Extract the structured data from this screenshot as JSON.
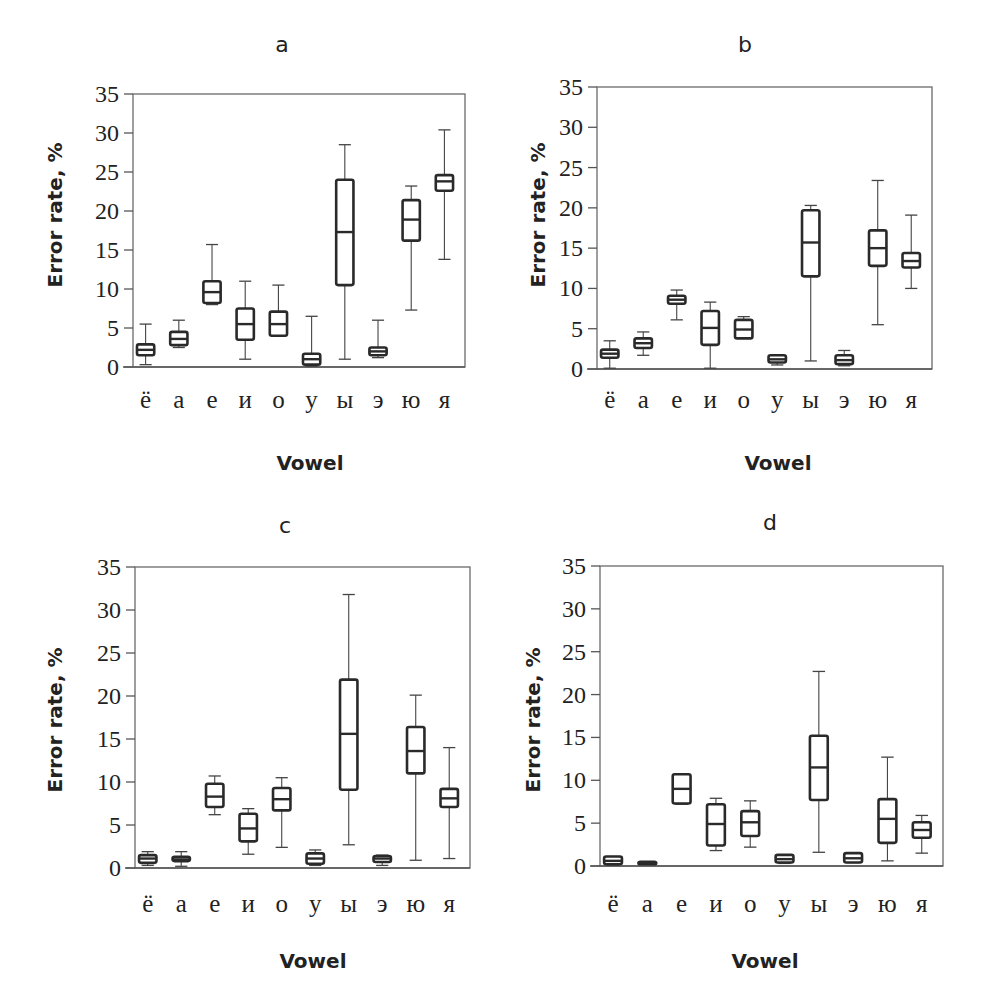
{
  "figure": {
    "panels_count": 4,
    "background_text_visible": true
  },
  "chart_data": [
    {
      "type": "box",
      "panel": "a",
      "title": "a",
      "xlabel": "Vowel",
      "ylabel": "Error rate, %",
      "ylim": [
        0,
        35
      ],
      "yticks": [
        0,
        5,
        10,
        15,
        20,
        25,
        30,
        35
      ],
      "grid": false,
      "categories": [
        "ё",
        "а",
        "е",
        "и",
        "о",
        "у",
        "ы",
        "э",
        "ю",
        "я"
      ],
      "series": [
        {
          "name": "ё",
          "min": 0.3,
          "q1": 1.5,
          "median": 2.2,
          "q3": 2.9,
          "max": 5.5
        },
        {
          "name": "а",
          "min": 2.5,
          "q1": 2.8,
          "median": 3.6,
          "q3": 4.5,
          "max": 6.0
        },
        {
          "name": "е",
          "min": 8.0,
          "q1": 8.2,
          "median": 9.6,
          "q3": 11.0,
          "max": 15.7
        },
        {
          "name": "и",
          "min": 1.0,
          "q1": 3.5,
          "median": 5.5,
          "q3": 7.5,
          "max": 11.0
        },
        {
          "name": "о",
          "min": 4.0,
          "q1": 4.0,
          "median": 5.5,
          "q3": 7.1,
          "max": 10.5
        },
        {
          "name": "у",
          "min": 0.1,
          "q1": 0.3,
          "median": 1.0,
          "q3": 1.7,
          "max": 6.5
        },
        {
          "name": "ы",
          "min": 1.0,
          "q1": 10.5,
          "median": 17.3,
          "q3": 24.0,
          "max": 28.5
        },
        {
          "name": "э",
          "min": 1.2,
          "q1": 1.5,
          "median": 2.0,
          "q3": 2.5,
          "max": 6.0
        },
        {
          "name": "ю",
          "min": 7.3,
          "q1": 16.2,
          "median": 18.9,
          "q3": 21.4,
          "max": 23.2
        },
        {
          "name": "я",
          "min": 13.8,
          "q1": 22.6,
          "median": 23.8,
          "q3": 24.6,
          "max": 30.4
        }
      ]
    },
    {
      "type": "box",
      "panel": "b",
      "title": "b",
      "xlabel": "Vowel",
      "ylabel": "Error rate, %",
      "ylim": [
        0,
        35
      ],
      "yticks": [
        0,
        5,
        10,
        15,
        20,
        25,
        30,
        35
      ],
      "grid": false,
      "categories": [
        "ё",
        "а",
        "е",
        "и",
        "о",
        "у",
        "ы",
        "э",
        "ю",
        "я"
      ],
      "series": [
        {
          "name": "ё",
          "min": 0.1,
          "q1": 1.4,
          "median": 1.9,
          "q3": 2.4,
          "max": 3.5
        },
        {
          "name": "а",
          "min": 1.7,
          "q1": 2.6,
          "median": 3.2,
          "q3": 3.8,
          "max": 4.6
        },
        {
          "name": "е",
          "min": 6.1,
          "q1": 8.1,
          "median": 8.6,
          "q3": 9.1,
          "max": 9.8
        },
        {
          "name": "и",
          "min": 0.1,
          "q1": 3.0,
          "median": 5.1,
          "q3": 7.2,
          "max": 8.3
        },
        {
          "name": "о",
          "min": 3.8,
          "q1": 3.8,
          "median": 4.9,
          "q3": 6.1,
          "max": 6.5
        },
        {
          "name": "у",
          "min": 0.5,
          "q1": 0.8,
          "median": 1.2,
          "q3": 1.7,
          "max": 1.7
        },
        {
          "name": "ы",
          "min": 1.0,
          "q1": 11.5,
          "median": 15.7,
          "q3": 19.7,
          "max": 20.3
        },
        {
          "name": "э",
          "min": 0.4,
          "q1": 0.6,
          "median": 1.1,
          "q3": 1.7,
          "max": 2.3
        },
        {
          "name": "ю",
          "min": 5.5,
          "q1": 12.8,
          "median": 15.0,
          "q3": 17.2,
          "max": 23.4
        },
        {
          "name": "я",
          "min": 10.0,
          "q1": 12.6,
          "median": 13.4,
          "q3": 14.4,
          "max": 19.1
        }
      ]
    },
    {
      "type": "box",
      "panel": "c",
      "title": "c",
      "xlabel": "Vowel",
      "ylabel": "Error rate, %",
      "ylim": [
        0,
        35
      ],
      "yticks": [
        0,
        5,
        10,
        15,
        20,
        25,
        30,
        35
      ],
      "grid": false,
      "categories": [
        "ё",
        "а",
        "е",
        "и",
        "о",
        "у",
        "ы",
        "э",
        "ю",
        "я"
      ],
      "series": [
        {
          "name": "ё",
          "min": 0.3,
          "q1": 0.6,
          "median": 1.1,
          "q3": 1.5,
          "max": 1.9
        },
        {
          "name": "а",
          "min": 0.2,
          "q1": 0.8,
          "median": 1.0,
          "q3": 1.3,
          "max": 1.9
        },
        {
          "name": "е",
          "min": 6.2,
          "q1": 7.1,
          "median": 8.3,
          "q3": 9.8,
          "max": 10.7
        },
        {
          "name": "и",
          "min": 1.6,
          "q1": 3.1,
          "median": 4.6,
          "q3": 6.3,
          "max": 6.9
        },
        {
          "name": "о",
          "min": 2.4,
          "q1": 6.7,
          "median": 8.0,
          "q3": 9.3,
          "max": 10.5
        },
        {
          "name": "у",
          "min": 0.3,
          "q1": 0.5,
          "median": 1.1,
          "q3": 1.7,
          "max": 2.1
        },
        {
          "name": "ы",
          "min": 2.7,
          "q1": 9.1,
          "median": 15.6,
          "q3": 21.9,
          "max": 31.8
        },
        {
          "name": "э",
          "min": 0.3,
          "q1": 0.7,
          "median": 1.1,
          "q3": 1.4,
          "max": 1.5
        },
        {
          "name": "ю",
          "min": 0.9,
          "q1": 11.0,
          "median": 13.6,
          "q3": 16.4,
          "max": 20.1
        },
        {
          "name": "я",
          "min": 1.1,
          "q1": 7.1,
          "median": 8.1,
          "q3": 9.2,
          "max": 14.0
        }
      ]
    },
    {
      "type": "box",
      "panel": "d",
      "title": "d",
      "xlabel": "Vowel",
      "ylabel": "Error rate, %",
      "ylim": [
        0,
        35
      ],
      "yticks": [
        0,
        5,
        10,
        15,
        20,
        25,
        30,
        35
      ],
      "grid": false,
      "categories": [
        "ё",
        "а",
        "е",
        "и",
        "о",
        "у",
        "ы",
        "э",
        "ю",
        "я"
      ],
      "series": [
        {
          "name": "ё",
          "min": 0.1,
          "q1": 0.2,
          "median": 0.6,
          "q3": 1.1,
          "max": 1.1
        },
        {
          "name": "а",
          "min": 0.2,
          "q1": 0.2,
          "median": 0.35,
          "q3": 0.5,
          "max": 0.5
        },
        {
          "name": "е",
          "min": 7.2,
          "q1": 7.3,
          "median": 9.0,
          "q3": 10.7,
          "max": 10.7
        },
        {
          "name": "и",
          "min": 1.8,
          "q1": 2.4,
          "median": 4.9,
          "q3": 7.2,
          "max": 7.9
        },
        {
          "name": "о",
          "min": 2.2,
          "q1": 3.5,
          "median": 5.1,
          "q3": 6.4,
          "max": 7.6
        },
        {
          "name": "у",
          "min": 0.3,
          "q1": 0.4,
          "median": 0.8,
          "q3": 1.3,
          "max": 1.3
        },
        {
          "name": "ы",
          "min": 1.6,
          "q1": 7.7,
          "median": 11.5,
          "q3": 15.2,
          "max": 22.7
        },
        {
          "name": "э",
          "min": 0.4,
          "q1": 0.4,
          "median": 0.9,
          "q3": 1.5,
          "max": 1.5
        },
        {
          "name": "ю",
          "min": 0.6,
          "q1": 2.7,
          "median": 5.5,
          "q3": 7.8,
          "max": 12.7
        },
        {
          "name": "я",
          "min": 1.5,
          "q1": 3.3,
          "median": 4.2,
          "q3": 5.1,
          "max": 5.9
        }
      ]
    }
  ],
  "layout": {
    "panels": [
      {
        "id": "a",
        "left": 133,
        "right": 465,
        "ytop": 94,
        "ybottom": 367,
        "titleX": 282,
        "titleY": 52,
        "xlabelX": 310,
        "xlabelY": 470,
        "catY": 408,
        "ylabelX": 62,
        "ylabelY": 215
      },
      {
        "id": "b",
        "left": 597,
        "right": 932,
        "ytop": 87,
        "ybottom": 369,
        "titleX": 745,
        "titleY": 52,
        "xlabelX": 778,
        "xlabelY": 470,
        "catY": 408,
        "ylabelX": 545,
        "ylabelY": 215
      },
      {
        "id": "c",
        "left": 135,
        "right": 470,
        "ytop": 567,
        "ybottom": 868,
        "titleX": 285,
        "titleY": 533,
        "xlabelX": 313,
        "xlabelY": 968,
        "catY": 912,
        "ylabelX": 62,
        "ylabelY": 720
      },
      {
        "id": "d",
        "left": 600,
        "right": 943,
        "ytop": 566,
        "ybottom": 866,
        "titleX": 770,
        "titleY": 530,
        "xlabelX": 765,
        "xlabelY": 968,
        "catY": 912,
        "ylabelX": 540,
        "ylabelY": 720
      }
    ]
  }
}
